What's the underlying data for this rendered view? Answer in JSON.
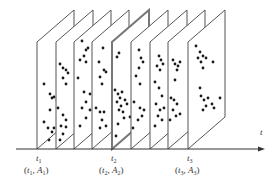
{
  "diagram": {
    "colors": {
      "edge": "#555555",
      "highlight_edge": "#777777",
      "dot": "#1a1a1a",
      "axis": "#333333"
    },
    "geometry": {
      "base_y": 149,
      "depth_dx": 37,
      "depth_dy": 32,
      "height": 107
    },
    "axis": {
      "x_start": 16,
      "x_end": 265,
      "y": 149,
      "label": "t"
    },
    "planes": [
      {
        "x": 37,
        "highlight": false,
        "dots": [
          [
            44,
            84
          ],
          [
            50,
            94
          ],
          [
            52,
            98
          ],
          [
            54,
            97
          ],
          [
            57,
            100
          ],
          [
            50,
            110
          ],
          [
            44,
            122
          ],
          [
            48,
            128
          ],
          [
            54,
            128
          ],
          [
            52,
            132
          ],
          [
            49,
            140
          ]
        ]
      },
      {
        "x": 56,
        "highlight": false,
        "dots": [
          [
            60,
            64
          ],
          [
            63,
            68
          ],
          [
            66,
            70
          ],
          [
            68,
            73
          ],
          [
            63,
            78
          ],
          [
            66,
            84
          ],
          [
            58,
            108
          ],
          [
            63,
            115
          ],
          [
            66,
            120
          ],
          [
            61,
            126
          ],
          [
            66,
            127
          ],
          [
            63,
            134
          ],
          [
            60,
            140
          ]
        ]
      },
      {
        "x": 74,
        "highlight": false,
        "dots": [
          [
            82,
            41
          ],
          [
            86,
            50
          ],
          [
            88,
            48
          ],
          [
            84,
            56
          ],
          [
            80,
            60
          ],
          [
            86,
            62
          ],
          [
            78,
            78
          ],
          [
            84,
            92
          ],
          [
            90,
            94
          ],
          [
            86,
            102
          ],
          [
            82,
            108
          ],
          [
            90,
            110
          ],
          [
            86,
            118
          ],
          [
            80,
            126
          ]
        ]
      },
      {
        "x": 92,
        "highlight": false,
        "dots": [
          [
            103,
            48
          ],
          [
            99,
            62
          ],
          [
            104,
            70
          ],
          [
            106,
            72
          ],
          [
            100,
            77
          ],
          [
            102,
            84
          ],
          [
            96,
            108
          ],
          [
            100,
            112
          ],
          [
            104,
            112
          ],
          [
            102,
            120
          ],
          [
            100,
            128
          ],
          [
            106,
            126
          ]
        ]
      },
      {
        "x": 112,
        "highlight": true,
        "dots": [
          [
            117,
            57
          ],
          [
            119,
            53
          ],
          [
            115,
            90
          ],
          [
            118,
            94
          ],
          [
            122,
            92
          ],
          [
            120,
            98
          ],
          [
            117,
            102
          ],
          [
            121,
            106
          ],
          [
            125,
            100
          ],
          [
            119,
            110
          ],
          [
            123,
            112
          ],
          [
            127,
            104
          ],
          [
            124,
            118
          ],
          [
            118,
            124
          ],
          [
            130,
            117
          ],
          [
            116,
            136
          ]
        ]
      },
      {
        "x": 131,
        "highlight": false,
        "dots": [
          [
            139,
            50
          ],
          [
            141,
            58
          ],
          [
            143,
            62
          ],
          [
            139,
            68
          ],
          [
            136,
            76
          ],
          [
            140,
            84
          ],
          [
            134,
            102
          ],
          [
            140,
            108
          ],
          [
            144,
            110
          ],
          [
            142,
            116
          ],
          [
            138,
            120
          ],
          [
            133,
            128
          ]
        ]
      },
      {
        "x": 150,
        "highlight": false,
        "dots": [
          [
            159,
            56
          ],
          [
            161,
            60
          ],
          [
            163,
            64
          ],
          [
            157,
            66
          ],
          [
            160,
            70
          ],
          [
            155,
            82
          ],
          [
            159,
            88
          ],
          [
            162,
            96
          ],
          [
            156,
            104
          ],
          [
            160,
            110
          ],
          [
            164,
            108
          ],
          [
            158,
            116
          ],
          [
            162,
            120
          ],
          [
            155,
            126
          ]
        ]
      },
      {
        "x": 168,
        "highlight": false,
        "dots": [
          [
            173,
            60
          ],
          [
            175,
            64
          ],
          [
            178,
            66
          ],
          [
            180,
            62
          ],
          [
            177,
            70
          ],
          [
            175,
            80
          ],
          [
            171,
            98
          ],
          [
            174,
            100
          ],
          [
            177,
            104
          ],
          [
            173,
            110
          ],
          [
            176,
            116
          ],
          [
            180,
            114
          ],
          [
            170,
            120
          ]
        ]
      },
      {
        "x": 188,
        "highlight": false,
        "dots": [
          [
            196,
            46
          ],
          [
            200,
            52
          ],
          [
            203,
            56
          ],
          [
            206,
            58
          ],
          [
            198,
            58
          ],
          [
            201,
            62
          ],
          [
            213,
            62
          ],
          [
            203,
            68
          ],
          [
            200,
            88
          ],
          [
            201,
            96
          ],
          [
            204,
            100
          ],
          [
            208,
            98
          ],
          [
            212,
            104
          ],
          [
            206,
            106
          ],
          [
            203,
            110
          ],
          [
            220,
            98
          ],
          [
            214,
            108
          ]
        ]
      }
    ],
    "labels": [
      {
        "x": 38,
        "t_text": "t",
        "t_sub": "1",
        "pair_t": "t",
        "pair_t_sub": "1",
        "pair_a": "A",
        "pair_a_sub": "1"
      },
      {
        "x": 113,
        "t_text": "t",
        "t_sub": "2",
        "pair_t": "t",
        "pair_t_sub": "2",
        "pair_a": "A",
        "pair_a_sub": "2"
      },
      {
        "x": 189,
        "t_text": "t",
        "t_sub": "3",
        "pair_t": "t",
        "pair_t_sub": "3",
        "pair_a": "A",
        "pair_a_sub": "3"
      }
    ]
  }
}
